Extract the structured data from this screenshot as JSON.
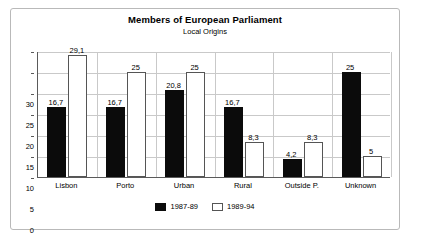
{
  "frame": {
    "border_color": "#b9b9b9",
    "background": "#ffffff"
  },
  "chart_data": {
    "type": "bar",
    "title": "Members of European Parliament",
    "subtitle": "Local Origins",
    "xlabel": "",
    "ylabel": "",
    "ylim": [
      0,
      30
    ],
    "yticks": [
      0,
      5,
      10,
      15,
      20,
      25,
      30
    ],
    "ytick_labels": [
      "0",
      "5",
      "10",
      "15",
      "20",
      "25",
      "30"
    ],
    "grid": true,
    "legend_position": "bottom-center",
    "decimal_separator": ",",
    "categories": [
      "Lisbon",
      "Porto",
      "Urban",
      "Rural",
      "Outside P.",
      "Unknown"
    ],
    "series": [
      {
        "name": "1987-89",
        "color": "#0b0b0b",
        "values": [
          16.7,
          16.7,
          20.8,
          16.7,
          4.2,
          25
        ],
        "labels": [
          "16,7",
          "16,7",
          "20,8",
          "16,7",
          "4,2",
          "25"
        ]
      },
      {
        "name": "1989-94",
        "color": "#ffffff",
        "values": [
          29.1,
          25,
          25,
          8.3,
          8.3,
          5
        ],
        "labels": [
          "29,1",
          "25",
          "25",
          "8,3",
          "8,3",
          "5"
        ]
      }
    ]
  }
}
